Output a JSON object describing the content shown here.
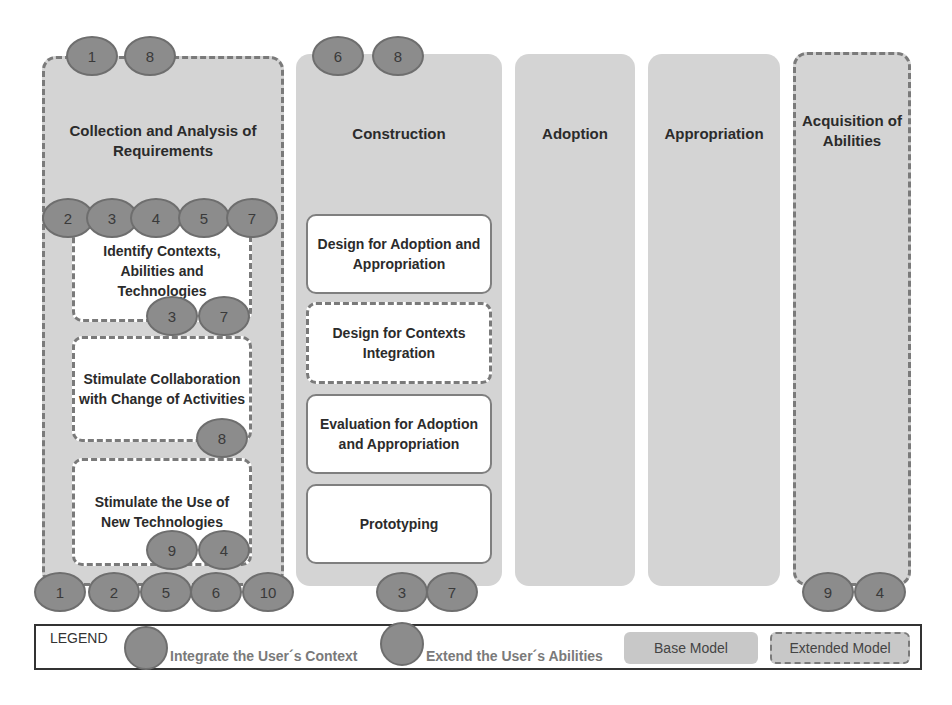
{
  "columns": [
    {
      "id": "collection",
      "title": "Collection and Analysis of Requirements",
      "model": "extended",
      "top_badges": [
        "1",
        "8"
      ],
      "bottom_badges": [
        "1",
        "2",
        "5",
        "6",
        "10"
      ]
    },
    {
      "id": "construction",
      "title": "Construction",
      "model": "base",
      "top_badges": [
        "6",
        "8"
      ],
      "bottom_badges": [
        "3",
        "7"
      ]
    },
    {
      "id": "adoption",
      "title": "Adoption",
      "model": "base"
    },
    {
      "id": "appropriation",
      "title": "Appropriation",
      "model": "base"
    },
    {
      "id": "acquisition",
      "title": "Acquisition of Abilities",
      "model": "extended",
      "bottom_badges": [
        "9",
        "4"
      ]
    }
  ],
  "collection_row_badges": [
    "2",
    "3",
    "4",
    "5",
    "7"
  ],
  "collection_activities": [
    {
      "label": "Identify Contexts, Abilities and Technologies",
      "model": "extended",
      "badges": [
        "3",
        "7"
      ]
    },
    {
      "label": "Stimulate Collaboration with Change of Activities",
      "model": "extended",
      "badges": [
        "8"
      ]
    },
    {
      "label": "Stimulate the Use of New Technologies",
      "model": "extended",
      "badges": [
        "9",
        "4"
      ]
    }
  ],
  "construction_activities": [
    {
      "label": "Design for Adoption and Appropriation",
      "model": "base"
    },
    {
      "label": "Design for Contexts Integration",
      "model": "extended"
    },
    {
      "label": "Evaluation for Adoption and Appropriation",
      "model": "base"
    },
    {
      "label": "Prototyping",
      "model": "base"
    }
  ],
  "legend": {
    "title": "LEGEND",
    "integrate": "Integrate the User´s Context",
    "extend": "Extend the User´s Abilities",
    "base": "Base Model",
    "extended": "Extended Model"
  },
  "colors": {
    "column_fill": "#d4d4d4",
    "badge_fill": "#8c8c8c",
    "dash": "#7a7a7a"
  }
}
